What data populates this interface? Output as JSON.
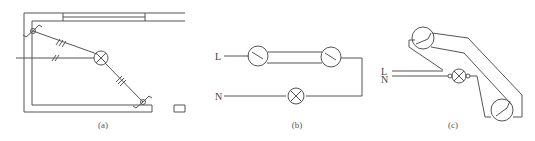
{
  "figure": {
    "panels": [
      {
        "id": "a",
        "caption": "(a)",
        "description": "floor-plan wiring: lamp with two switches"
      },
      {
        "id": "b",
        "caption": "(b)",
        "description": "schematic: two two-way switches controlling one lamp"
      },
      {
        "id": "c",
        "caption": "(c)",
        "description": "wiring layout: two switches and lamp"
      }
    ],
    "labels": {
      "b_live": "L",
      "b_neutral": "N",
      "c_live": "L",
      "c_neutral": "N"
    },
    "components": {
      "lamp_symbol": "lamp-icon",
      "switch_symbol": "two-way-switch-icon"
    }
  }
}
